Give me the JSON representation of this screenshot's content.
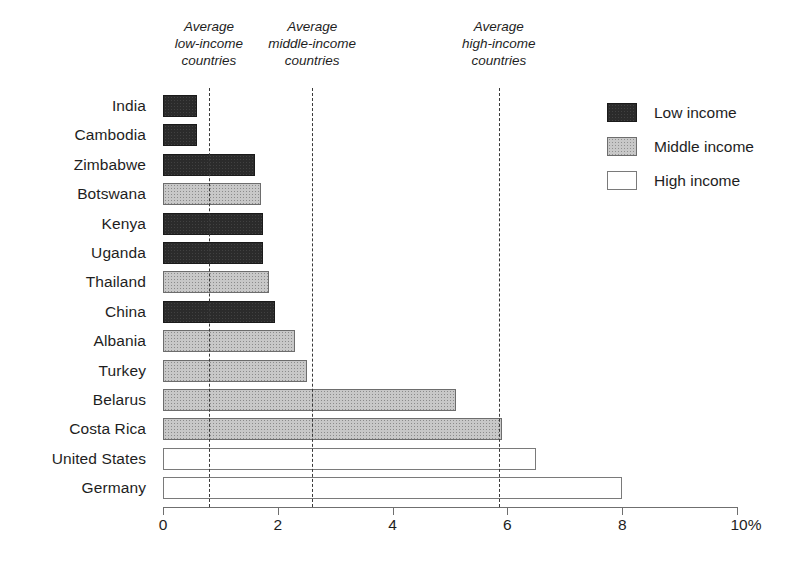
{
  "chart_data": {
    "type": "bar",
    "orientation": "horizontal",
    "title": "",
    "subtitle": "",
    "xlabel": "",
    "ylabel": "",
    "xlim": [
      0,
      10
    ],
    "xticks": [
      0,
      2,
      4,
      6,
      8,
      10
    ],
    "xtick_labels": [
      "0",
      "2",
      "4",
      "6",
      "8",
      "10%"
    ],
    "grid": false,
    "categories": [
      "India",
      "Cambodia",
      "Zimbabwe",
      "Botswana",
      "Kenya",
      "Uganda",
      "Thailand",
      "China",
      "Albania",
      "Turkey",
      "Belarus",
      "Costa Rica",
      "United States",
      "Germany"
    ],
    "values": [
      0.6,
      0.6,
      1.6,
      1.7,
      1.75,
      1.75,
      1.85,
      1.95,
      2.3,
      2.5,
      5.1,
      5.9,
      6.5,
      8.0
    ],
    "groups": [
      "low",
      "low",
      "low",
      "middle",
      "low",
      "low",
      "middle",
      "low",
      "middle",
      "middle",
      "middle",
      "middle",
      "high",
      "high"
    ],
    "legend": {
      "position": "top-right",
      "entries": [
        {
          "key": "low",
          "label": "Low income",
          "color": "#2b2b2b"
        },
        {
          "key": "middle",
          "label": "Middle income",
          "color": "#c8c8c8"
        },
        {
          "key": "high",
          "label": "High income",
          "color": "#ffffff"
        }
      ]
    },
    "reference_lines": [
      {
        "key": "low-income-average",
        "value": 0.8,
        "label": "Average\nlow-income\ncountries",
        "label_lines": [
          "Average",
          "low-income",
          "countries"
        ]
      },
      {
        "key": "middle-income-average",
        "value": 2.6,
        "label": "Average\nmiddle-income\ncountries",
        "label_lines": [
          "Average",
          "middle-income",
          "countries"
        ]
      },
      {
        "key": "high-income-average",
        "value": 5.85,
        "label": "Average\nhigh-income\ncountries",
        "label_lines": [
          "Average",
          "high-income",
          "countries"
        ]
      }
    ]
  },
  "colors": {
    "low_income": "#2b2b2b",
    "middle_income": "#c8c8c8",
    "high_income": "#ffffff",
    "axis": "#6f6f6f",
    "text": "#1e1e1e",
    "reference_line": "#3a3a3a",
    "background": "#ffffff"
  }
}
